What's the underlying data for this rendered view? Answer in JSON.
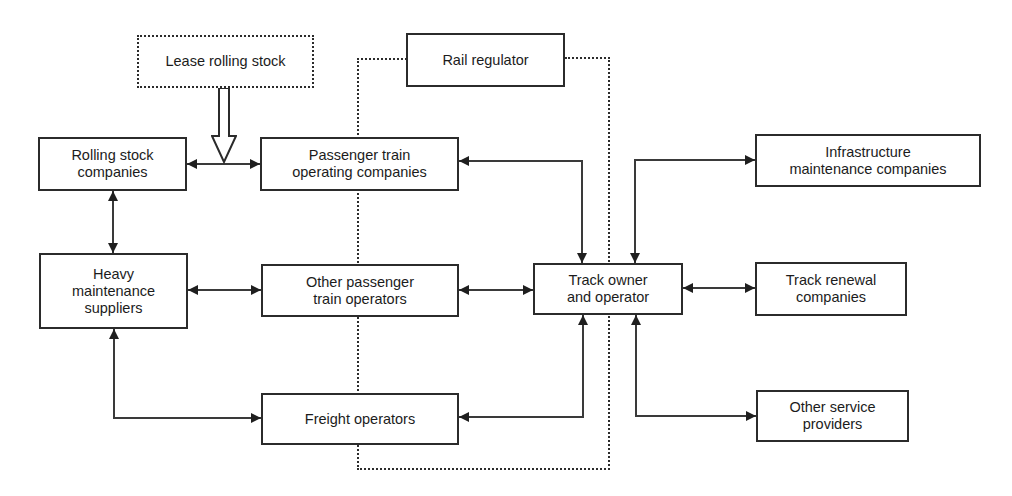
{
  "figure": {
    "type": "organisation-flow-diagram",
    "background_color": "#ffffff",
    "line_color": "#3a3a3a",
    "arrow_color": "#1f1f1f",
    "box_border_color": "#2b2b2b",
    "text_color": "#1c1c1c"
  },
  "nodes": [
    {
      "id": "lease-rolling-stock",
      "label": "Lease rolling stock",
      "border": "dashed"
    },
    {
      "id": "rail-regulator",
      "label": "Rail regulator",
      "border": "solid"
    },
    {
      "id": "rolling-stock-companies",
      "label": "Rolling stock\ncompanies",
      "border": "solid"
    },
    {
      "id": "passenger-train-operating-companies",
      "label": "Passenger train\noperating companies",
      "border": "solid"
    },
    {
      "id": "infrastructure-maintenance-companies",
      "label": "Infrastructure\nmaintenance companies",
      "border": "solid"
    },
    {
      "id": "heavy-maintenance-suppliers",
      "label": "Heavy\nmaintenance\nsuppliers",
      "border": "solid"
    },
    {
      "id": "other-passenger-train-operators",
      "label": "Other passenger\ntrain operators",
      "border": "solid"
    },
    {
      "id": "track-owner-and-operator",
      "label": "Track owner\nand operator",
      "border": "solid"
    },
    {
      "id": "track-renewal-companies",
      "label": "Track renewal\ncompanies",
      "border": "solid"
    },
    {
      "id": "freight-operators",
      "label": "Freight operators",
      "border": "solid"
    },
    {
      "id": "other-service-providers",
      "label": "Other service\nproviders",
      "border": "solid"
    }
  ],
  "edges": [
    {
      "from": "lease-rolling-stock",
      "to": "rolling-stock-companies + passenger-train-operating-companies link",
      "style": "hollow-block-arrow",
      "direction": "one-way-down"
    },
    {
      "from": "rolling-stock-companies",
      "to": "passenger-train-operating-companies",
      "style": "solid",
      "direction": "two-way"
    },
    {
      "from": "rolling-stock-companies",
      "to": "heavy-maintenance-suppliers",
      "style": "solid",
      "direction": "two-way"
    },
    {
      "from": "heavy-maintenance-suppliers",
      "to": "other-passenger-train-operators",
      "style": "solid",
      "direction": "two-way"
    },
    {
      "from": "heavy-maintenance-suppliers",
      "to": "freight-operators",
      "style": "solid",
      "direction": "two-way"
    },
    {
      "from": "passenger-train-operating-companies",
      "to": "track-owner-and-operator",
      "style": "solid",
      "direction": "two-way"
    },
    {
      "from": "other-passenger-train-operators",
      "to": "track-owner-and-operator",
      "style": "solid",
      "direction": "two-way"
    },
    {
      "from": "freight-operators",
      "to": "track-owner-and-operator",
      "style": "solid",
      "direction": "two-way"
    },
    {
      "from": "track-owner-and-operator",
      "to": "infrastructure-maintenance-companies",
      "style": "solid",
      "direction": "two-way"
    },
    {
      "from": "track-owner-and-operator",
      "to": "track-renewal-companies",
      "style": "solid",
      "direction": "two-way"
    },
    {
      "from": "track-owner-and-operator",
      "to": "other-service-providers",
      "style": "solid",
      "direction": "two-way"
    },
    {
      "from": "rail-regulator",
      "to": "operators and track owner",
      "style": "dashed-boundary-loop",
      "direction": "none"
    }
  ]
}
